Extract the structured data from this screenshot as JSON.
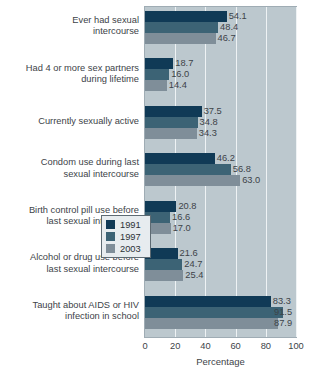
{
  "chart_data": {
    "type": "bar",
    "orientation": "horizontal",
    "title": "",
    "xlabel": "Percentage",
    "ylabel": "",
    "xlim": [
      0,
      100
    ],
    "xticks": [
      0,
      20,
      40,
      60,
      80,
      100
    ],
    "grid": true,
    "legend_position": "middle-right-inside",
    "categories": [
      "Ever had sexual\nintercourse",
      "Had 4 or more sex partners\nduring lifetime",
      "Currently sexually active",
      "Condom use during last\nsexual intercourse",
      "Birth control pill use before\nlast sexual intercourse",
      "Alcohol or drug use before\nlast sexual intercourse",
      "Taught about AIDS or HIV\ninfection in school"
    ],
    "series": [
      {
        "name": "1991",
        "color": "#103a56",
        "values": [
          54.1,
          18.7,
          37.5,
          46.2,
          20.8,
          21.6,
          83.3
        ],
        "labels": [
          "54.1",
          "18.7",
          "37.5",
          "46.2",
          "20.8",
          "21.6",
          "83.3"
        ]
      },
      {
        "name": "1997",
        "color": "#3c6375",
        "values": [
          48.4,
          16.0,
          34.8,
          56.8,
          16.6,
          24.7,
          91.5
        ],
        "labels": [
          "48.4",
          "16.0",
          "34.8",
          "56.8",
          "16.6",
          "24.7",
          "91.5"
        ]
      },
      {
        "name": "2003",
        "color": "#7f8e99",
        "values": [
          46.7,
          14.4,
          34.3,
          63.0,
          17.0,
          25.4,
          87.9
        ],
        "labels": [
          "46.7",
          "14.4",
          "34.3",
          "63.0",
          "17.0",
          "25.4",
          "87.9"
        ]
      }
    ]
  },
  "axis": {
    "tick_labels": [
      "0",
      "20",
      "40",
      "60",
      "80",
      "100"
    ],
    "title": "Percentage"
  },
  "legend": {
    "items": [
      {
        "label": "1991",
        "color": "#103a56"
      },
      {
        "label": "1997",
        "color": "#3c6375"
      },
      {
        "label": "2003",
        "color": "#7f8e99"
      }
    ]
  },
  "colors": {
    "plot_background": "#bcc8ce",
    "gridline": "#eef2f4",
    "text": "#3d4348",
    "page_background": "#ffffff"
  }
}
